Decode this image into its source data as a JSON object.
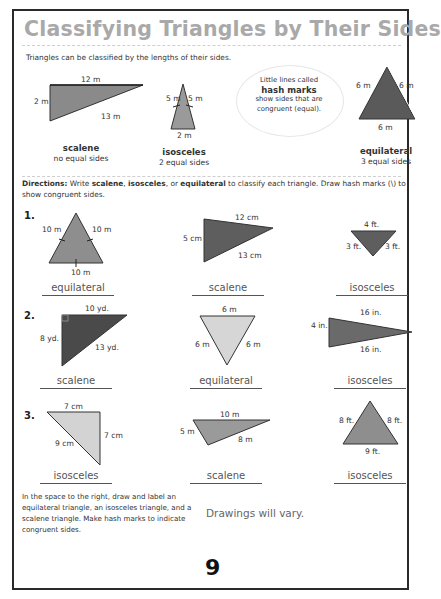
{
  "title": "Classifying Triangles by Their Sides",
  "intro": {
    "text": "Triangles can be classified by the lengths of their sides.",
    "examples": [
      {
        "type": "scalene",
        "desc": "no equal sides",
        "sides": [
          "12 m",
          "2 m",
          "13 m"
        ]
      },
      {
        "type": "isosceles",
        "desc": "2 equal sides",
        "sides": [
          "5 m",
          "5 m",
          "2 m"
        ]
      },
      {
        "type": "equilateral",
        "desc": "3 equal sides",
        "sides": [
          "6 m",
          "6 m",
          "6 m"
        ]
      }
    ],
    "callout": {
      "line1": "Little lines called",
      "line2": "hash marks",
      "line3": "show sides that are",
      "line4": "congruent (equal)."
    }
  },
  "directions": {
    "label": "Directions:",
    "text_a": " Write ",
    "w1": "scalene",
    "sep1": ", ",
    "w2": "isosceles",
    "sep2": ", or ",
    "w3": "equilateral",
    "text_b": " to classify each triangle. Draw hash marks (\\) to show congruent sides."
  },
  "problems": [
    {
      "number": "1.",
      "items": [
        {
          "sides": [
            "10 m",
            "10 m",
            "10 m"
          ],
          "answer": "equilateral"
        },
        {
          "sides": [
            "12 cm",
            "5 cm",
            "13 cm"
          ],
          "answer": "scalene"
        },
        {
          "sides": [
            "4 ft.",
            "3 ft.",
            "3 ft."
          ],
          "answer": "isosceles"
        }
      ]
    },
    {
      "number": "2.",
      "items": [
        {
          "sides": [
            "10 yd.",
            "8 yd.",
            "13 yd."
          ],
          "answer": "scalene"
        },
        {
          "sides": [
            "6 m",
            "6 m",
            "6 m"
          ],
          "answer": "equilateral"
        },
        {
          "sides": [
            "16 in.",
            "4 in.",
            "16 in."
          ],
          "answer": "isosceles"
        }
      ]
    },
    {
      "number": "3.",
      "items": [
        {
          "sides": [
            "7 cm",
            "9 cm",
            "7 cm"
          ],
          "answer": "isosceles"
        },
        {
          "sides": [
            "10 m",
            "5 m",
            "8 m"
          ],
          "answer": "scalene"
        },
        {
          "sides": [
            "8 ft.",
            "8 ft.",
            "9 ft."
          ],
          "answer": "isosceles"
        }
      ]
    }
  ],
  "drawing_task": {
    "instructions": "In the space to the right, draw and label an equilateral triangle, an isosceles triangle, and a scalene triangle. Make hash marks to indicate congruent sides.",
    "answer": "Drawings will vary."
  },
  "page_number": "9",
  "colors": {
    "title": "#a9a9a9",
    "dark_fill": "#6b6b6b",
    "mid_fill": "#9a9a9a",
    "light_fill": "#d9d9d9",
    "border": "#2a2a2a"
  }
}
